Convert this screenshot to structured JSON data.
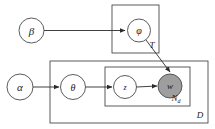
{
  "diagram": {
    "type": "plate-notation-graphical-model",
    "title": "",
    "background_color": "#ffffff",
    "stroke_color": "#4a4a4a",
    "observed_fill": "#9e9e9e",
    "latent_fill": "#ffffff",
    "nodes": [
      {
        "id": "beta",
        "label": "β",
        "observed": false,
        "cx": 31.5,
        "cy": 30.5,
        "r": 12.5,
        "font_size": 11
      },
      {
        "id": "phi",
        "label": "φ",
        "observed": false,
        "cx": 139,
        "cy": 30.5,
        "r": 11.5,
        "font_size": 10
      },
      {
        "id": "alpha",
        "label": "α",
        "observed": false,
        "cx": 20,
        "cy": 87,
        "r": 13,
        "font_size": 11
      },
      {
        "id": "theta",
        "label": "θ",
        "observed": false,
        "cx": 73,
        "cy": 87,
        "r": 12.5,
        "font_size": 10
      },
      {
        "id": "z",
        "label": "z",
        "observed": false,
        "cx": 125,
        "cy": 87,
        "r": 11.5,
        "font_size": 8
      },
      {
        "id": "w",
        "label": "w",
        "observed": true,
        "cx": 170,
        "cy": 86,
        "r": 12,
        "font_size": 9
      }
    ],
    "plates": [
      {
        "id": "plate-T",
        "label": "T",
        "x": 112,
        "y": 5,
        "width": 47,
        "height": 48,
        "label_x": 152,
        "label_y": 48,
        "font_size": 9
      },
      {
        "id": "plate-D",
        "label": "D",
        "x": 50,
        "y": 61,
        "width": 158,
        "height": 62,
        "label_x": 200,
        "label_y": 118,
        "font_size": 9
      },
      {
        "id": "plate-Nd",
        "label": "N",
        "sublabel": "d",
        "x": 105,
        "y": 67,
        "width": 85,
        "height": 39,
        "label_x": 176,
        "label_y": 101,
        "font_size": 9,
        "sub_font_size": 6
      }
    ],
    "edges": [
      {
        "id": "beta-to-phi",
        "from": "beta",
        "to": "phi",
        "x1": 44,
        "y1": 30.5,
        "x2": 125,
        "y2": 30.5
      },
      {
        "id": "phi-to-w",
        "from": "phi",
        "to": "w",
        "x1": 146,
        "y1": 40,
        "x2": 170,
        "y2": 72
      },
      {
        "id": "alpha-to-theta",
        "from": "alpha",
        "to": "theta",
        "x1": 33,
        "y1": 87,
        "x2": 59,
        "y2": 87
      },
      {
        "id": "theta-to-z",
        "from": "theta",
        "to": "z",
        "x1": 85.5,
        "y1": 87,
        "x2": 112,
        "y2": 87
      },
      {
        "id": "z-to-w",
        "from": "z",
        "to": "w",
        "x1": 136.5,
        "y1": 87,
        "x2": 157,
        "y2": 86
      }
    ]
  }
}
